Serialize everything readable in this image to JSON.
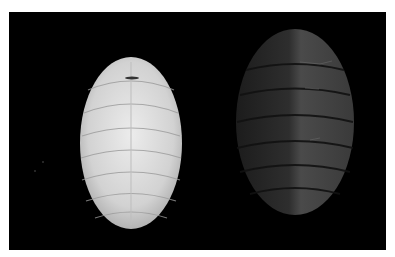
{
  "image": {
    "description": "Two chiton specimens photographed dorsally on a black background",
    "background_color": "#000000",
    "border_color": "#ffffff",
    "specimens": [
      {
        "name": "pale-chiton",
        "color": "#d8d8d8",
        "plates": 8
      },
      {
        "name": "dark-chiton",
        "color": "#3a3a3a",
        "plates": 8
      }
    ]
  }
}
